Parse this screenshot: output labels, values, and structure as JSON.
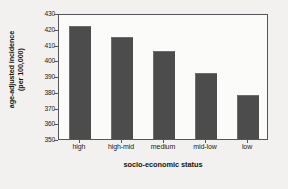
{
  "chart_data": {
    "type": "bar",
    "title": "",
    "xlabel": "socio-economic status",
    "ylabel": "age-adjusted incidence (per 100,000)",
    "ylabel_line1": "age-adjusted incidence",
    "ylabel_line2": "(per 100,000)",
    "categories": [
      "high",
      "high-mid",
      "medium",
      "mid-low",
      "low"
    ],
    "values": [
      421.5,
      414.5,
      406,
      392,
      378
    ],
    "ylim": [
      350,
      430
    ],
    "ytick_values": [
      350,
      360,
      370,
      380,
      390,
      400,
      410,
      420,
      430
    ],
    "ytick_labels": [
      "350",
      "360",
      "370",
      "380",
      "390",
      "400",
      "410",
      "420",
      "430"
    ],
    "grid": false,
    "legend": "none",
    "bar_color": "#4c4c4c",
    "axis_color": "#56565a",
    "plot_background": "#fbfbfa",
    "figure_background": "#f2f1ef"
  }
}
